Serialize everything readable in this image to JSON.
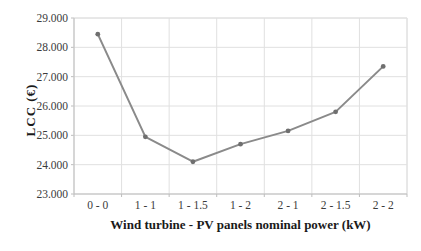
{
  "chart_data": {
    "type": "line",
    "categories": [
      "0 - 0",
      "1 - 1",
      "1 - 1.5",
      "1 - 2",
      "2 - 1",
      "2 - 1.5",
      "2 - 2"
    ],
    "values": [
      28450,
      24950,
      24100,
      24700,
      25150,
      25800,
      27350
    ],
    "series_name": "LCC",
    "title": "",
    "xlabel": "Wind turbine - PV panels nominal power (kW)",
    "ylabel": "LCC (€)",
    "ylim": [
      23000,
      29000
    ],
    "ytick_interval": 1000,
    "ytick_labels": [
      "23.000",
      "24.000",
      "25.000",
      "26.000",
      "27.000",
      "28.000",
      "29.000"
    ],
    "grid": true,
    "legend": "none",
    "colors": {
      "line": "#8a8a8a",
      "marker": "#6f6f6f",
      "gridline": "#e0e0e0",
      "axis": "#bdbdbd",
      "tick_text": "#3b3b3b",
      "title_text": "#1a1a1a",
      "background": "#ffffff"
    }
  }
}
